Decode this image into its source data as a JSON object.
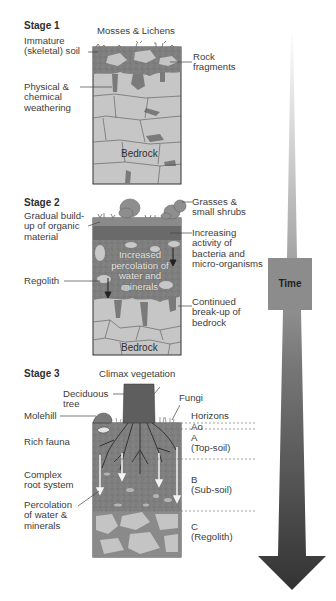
{
  "diagram": {
    "time_arrow": {
      "label": "Time",
      "direction": "down",
      "colors": {
        "top": "#f0f0f0",
        "bottom": "#3a3a3a",
        "box": "#8a8a8a"
      }
    },
    "colors": {
      "bedrock": "#c8c8c8",
      "soil_dark": "#7c7c7c",
      "organic": "#6a6a6a",
      "weathering": "#7a7a7a",
      "outline": "#333333",
      "tree": "#5a5a5a"
    },
    "stages": [
      {
        "title": "Stage 1",
        "top_label": "Mosses & Lichens",
        "left_labels": [
          "Immature (skeletal) soil",
          "Physical & chemical weathering"
        ],
        "right_labels": [
          "Rock fragments"
        ],
        "inner_labels": [
          "Bedrock"
        ]
      },
      {
        "title": "Stage 2",
        "top_label": "",
        "left_labels": [
          "Gradual build-up of organic material",
          "Regolith"
        ],
        "right_labels": [
          "Grasses & small shrubs",
          "Increasing activity of bacteria and micro-organisms",
          "Continued break-up of bedrock"
        ],
        "inner_labels": [
          "Increased percolation of water and minerals",
          "Bedrock"
        ]
      },
      {
        "title": "Stage 3",
        "top_label": "Climax vegetation",
        "left_labels": [
          "Deciduous tree",
          "Molehill",
          "Rich fauna",
          "Complex root system",
          "Percolation of water & minerals"
        ],
        "right_labels": [
          "Fungi"
        ],
        "horizons": {
          "heading": "Horizons",
          "layers": [
            {
              "code": "Ao",
              "name": ""
            },
            {
              "code": "A",
              "name": "(Top-soil)"
            },
            {
              "code": "B",
              "name": "(Sub-soil)"
            },
            {
              "code": "C",
              "name": "(Regolith)"
            }
          ]
        }
      }
    ]
  },
  "text": {
    "s1_title": "Stage 1",
    "s1_mosses": "Mosses & Lichens",
    "s1_immature_1": "Immature",
    "s1_immature_2": "(skeletal) soil",
    "s1_rock_1": "Rock",
    "s1_rock_2": "fragments",
    "s1_phys_1": "Physical &",
    "s1_phys_2": "chemical",
    "s1_phys_3": "weathering",
    "s1_bedrock": "Bedrock",
    "s2_title": "Stage 2",
    "s2_grasses_1": "Grasses &",
    "s2_grasses_2": "small shrubs",
    "s2_gradual_1": "Gradual build-",
    "s2_gradual_2": "up of organic",
    "s2_gradual_3": "material",
    "s2_increasing_1": "Increasing",
    "s2_increasing_2": "activity of",
    "s2_increasing_3": "bacteria and",
    "s2_increasing_4": "micro-organisms",
    "s2_perc_1": "Increased",
    "s2_perc_2": "percolation of",
    "s2_perc_3": "water and",
    "s2_perc_4": "minerals",
    "s2_regolith": "Regolith",
    "s2_breakup_1": "Continued",
    "s2_breakup_2": "break-up of",
    "s2_breakup_3": "bedrock",
    "s2_bedrock": "Bedrock",
    "s3_title": "Stage 3",
    "s3_climax": "Climax vegetation",
    "s3_tree_1": "Deciduous",
    "s3_tree_2": "tree",
    "s3_fungi": "Fungi",
    "s3_molehill": "Molehill",
    "s3_horizons": "Horizons",
    "s3_ao": "Ao",
    "s3_a": "A",
    "s3_a_name": "(Top-soil)",
    "s3_fauna": "Rich fauna",
    "s3_root_1": "Complex",
    "s3_root_2": "root system",
    "s3_b": "B",
    "s3_b_name": "(Sub-soil)",
    "s3_perc_1": "Percolation",
    "s3_perc_2": "of water &",
    "s3_perc_3": "minerals",
    "s3_c": "C",
    "s3_c_name": "(Regolith)",
    "time": "Time"
  }
}
